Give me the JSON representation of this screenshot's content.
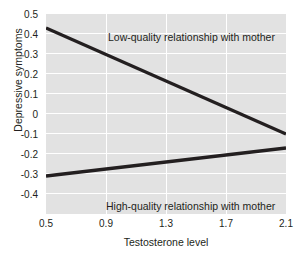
{
  "chart_data": {
    "type": "line",
    "title": "",
    "xlabel": "Testosterone level",
    "ylabel": "Depressive symptoms",
    "xlim": [
      0.5,
      2.1
    ],
    "ylim": [
      -0.5,
      0.5
    ],
    "xticks": [
      "0.5",
      "0.9",
      "1.3",
      "1.7",
      "2.1"
    ],
    "xtick_values": [
      0.5,
      0.9,
      1.3,
      1.7,
      2.1
    ],
    "yticks": [
      "0.5",
      "0.4",
      "0.3",
      "0.2",
      "0.1",
      "0",
      "-0.1",
      "-0.2",
      "-0.3",
      "-0.4"
    ],
    "ytick_values": [
      0.5,
      0.4,
      0.3,
      0.2,
      0.1,
      0,
      -0.1,
      -0.2,
      -0.3,
      -0.4
    ],
    "grid": true,
    "grid_color": "#ffffff",
    "plot_background": "#e2e2e2",
    "line_color": "#231f20",
    "legend_position": "inline-annotations",
    "series": [
      {
        "name": "Low-quality relationship with mother",
        "x": [
          0.5,
          2.1
        ],
        "values": [
          0.43,
          -0.1
        ]
      },
      {
        "name": "High-quality relationship with mother",
        "x": [
          0.5,
          2.1
        ],
        "values": [
          -0.31,
          -0.17
        ]
      }
    ],
    "annotations": [
      {
        "text": "Low-quality relationship with mother"
      },
      {
        "text": "High-quality relationship with mother"
      }
    ]
  }
}
